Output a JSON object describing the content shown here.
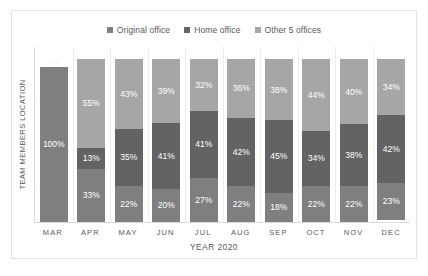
{
  "chart_data": {
    "type": "bar",
    "subtype": "stacked-percent-column",
    "title": "",
    "xlabel": "YEAR 2020",
    "ylabel": "TEAM MEMBERS LOCATION",
    "ylim": [
      0,
      100
    ],
    "grid": true,
    "legend_position": "top-center",
    "categories": [
      "MAR",
      "APR",
      "MAY",
      "JUN",
      "JUL",
      "AUG",
      "SEP",
      "OCT",
      "NOV",
      "DEC"
    ],
    "series": [
      {
        "name": "Original office",
        "color": "#7F7F7F",
        "values": [
          100,
          33,
          22,
          20,
          27,
          22,
          18,
          22,
          22,
          23
        ],
        "labels": [
          "100%",
          "33%",
          "22%",
          "20%",
          "27%",
          "22%",
          "18%",
          "22%",
          "22%",
          "23%"
        ]
      },
      {
        "name": "Home office",
        "color": "#636363",
        "values": [
          0,
          13,
          35,
          41,
          41,
          42,
          45,
          34,
          38,
          42
        ],
        "labels": [
          "",
          "13%",
          "35%",
          "41%",
          "41%",
          "42%",
          "45%",
          "34%",
          "38%",
          "42%"
        ]
      },
      {
        "name": "Other 5 offices",
        "color": "#A6A6A6",
        "values": [
          0,
          55,
          43,
          39,
          32,
          36,
          38,
          44,
          40,
          34
        ],
        "labels": [
          "0%",
          "55%",
          "43%",
          "39%",
          "32%",
          "36%",
          "38%",
          "44%",
          "40%",
          "34%"
        ]
      }
    ]
  },
  "legend": {
    "entries": [
      {
        "label": "Original office",
        "color": "#7F7F7F"
      },
      {
        "label": "Home office",
        "color": "#636363"
      },
      {
        "label": "Other 5 offices",
        "color": "#A6A6A6"
      }
    ]
  },
  "axes": {
    "y_title": "TEAM MEMBERS LOCATION",
    "x_title": "YEAR 2020",
    "x_ticks": [
      "MAR",
      "APR",
      "MAY",
      "JUN",
      "JUL",
      "AUG",
      "SEP",
      "OCT",
      "NOV",
      "DEC"
    ]
  }
}
